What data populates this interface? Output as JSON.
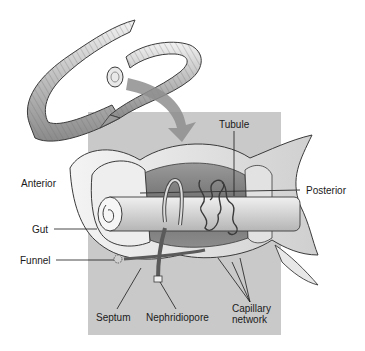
{
  "figure": {
    "colors": {
      "background": "#ffffff",
      "panel": "#c9c9c9",
      "body_wall": "#e6e6e6",
      "outline": "#3a3a3a",
      "arrow": "#8e8e8e",
      "label_text": "#1a1a1a"
    }
  },
  "labels": {
    "tubule": "Tubule",
    "anterior": "Anterior",
    "posterior": "Posterior",
    "gut": "Gut",
    "funnel": "Funnel",
    "septum": "Septum",
    "nephridiopore": "Nephridiopore",
    "capillary_network": "Capillary\nnetwork"
  }
}
